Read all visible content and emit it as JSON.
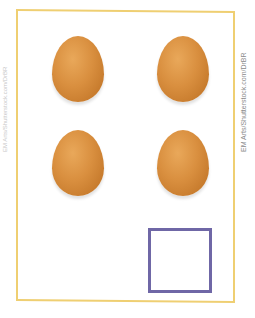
{
  "credit": {
    "right": "EM Arts/Shutterstock.com/DrBR",
    "left": "EM Arts/Shutterstock.com/DrBR"
  },
  "content": {
    "eggs": [
      {
        "row": 1,
        "col": 1
      },
      {
        "row": 1,
        "col": 2
      },
      {
        "row": 2,
        "col": 1
      },
      {
        "row": 2,
        "col": 2
      }
    ],
    "egg_count": 4,
    "answer_box": ""
  },
  "colors": {
    "frame": "#efcf72",
    "egg": "#d98f3f",
    "answer_box": "#6f67a6"
  }
}
